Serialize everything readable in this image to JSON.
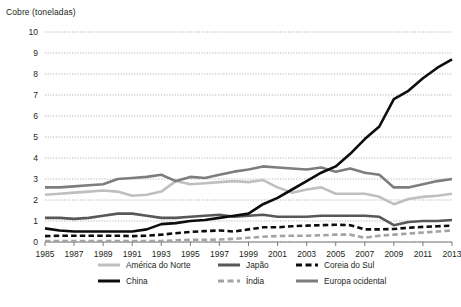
{
  "chart_data": {
    "type": "line",
    "title": "Cobre (toneladas)",
    "xlabel": "",
    "ylabel": "Cobre (toneladas)",
    "ylim": [
      0,
      10
    ],
    "ytick_step": 1,
    "yticks": [
      "0",
      "1",
      "2",
      "3",
      "4",
      "5",
      "6",
      "7",
      "8",
      "9",
      "10"
    ],
    "xlim": [
      1985,
      2013
    ],
    "xtick_labels": [
      "1985",
      "1987",
      "1989",
      "1991",
      "1993",
      "1995",
      "1997",
      "1999",
      "2001",
      "2003",
      "2005",
      "2007",
      "2009",
      "2011",
      "2013"
    ],
    "grid": "horizontal-dotted",
    "legend_position": "bottom",
    "x": [
      1985,
      1986,
      1987,
      1988,
      1989,
      1990,
      1991,
      1992,
      1993,
      1994,
      1995,
      1996,
      1997,
      1998,
      1999,
      2000,
      2001,
      2002,
      2003,
      2004,
      2005,
      2006,
      2007,
      2008,
      2009,
      2010,
      2011,
      2012,
      2013
    ],
    "series": [
      {
        "name": "América do Norte",
        "color": "#bfbfbf",
        "dash": "solid",
        "width": 2.6,
        "values": [
          2.25,
          2.3,
          2.35,
          2.4,
          2.45,
          2.4,
          2.2,
          2.25,
          2.4,
          2.9,
          2.75,
          2.8,
          2.85,
          2.9,
          2.85,
          2.95,
          2.6,
          2.35,
          2.5,
          2.6,
          2.3,
          2.3,
          2.3,
          2.15,
          1.8,
          2.05,
          2.15,
          2.2,
          2.3
        ]
      },
      {
        "name": "China",
        "color": "#0d0d0d",
        "dash": "solid",
        "width": 2.6,
        "values": [
          0.65,
          0.55,
          0.5,
          0.5,
          0.5,
          0.5,
          0.5,
          0.6,
          0.85,
          0.9,
          1.0,
          1.05,
          1.15,
          1.25,
          1.35,
          1.8,
          2.1,
          2.5,
          2.9,
          3.3,
          3.6,
          4.2,
          4.9,
          5.5,
          6.8,
          7.2,
          7.8,
          8.3,
          8.7
        ]
      },
      {
        "name": "Japão",
        "color": "#585858",
        "dash": "solid",
        "width": 2.6,
        "values": [
          1.15,
          1.15,
          1.1,
          1.15,
          1.25,
          1.35,
          1.35,
          1.25,
          1.15,
          1.15,
          1.2,
          1.25,
          1.3,
          1.2,
          1.25,
          1.3,
          1.2,
          1.2,
          1.2,
          1.25,
          1.25,
          1.25,
          1.25,
          1.2,
          0.8,
          0.95,
          1.0,
          1.0,
          1.05
        ]
      },
      {
        "name": "Índia",
        "color": "#a3a3a3",
        "dash": "dashed",
        "width": 2.6,
        "values": [
          0.05,
          0.05,
          0.05,
          0.05,
          0.05,
          0.05,
          0.05,
          0.05,
          0.05,
          0.08,
          0.1,
          0.1,
          0.12,
          0.15,
          0.2,
          0.25,
          0.28,
          0.3,
          0.3,
          0.32,
          0.35,
          0.35,
          0.2,
          0.3,
          0.35,
          0.4,
          0.45,
          0.5,
          0.55
        ]
      },
      {
        "name": "Coreia do Sul",
        "color": "#0d0d0d",
        "dash": "dashed",
        "width": 2.6,
        "values": [
          0.28,
          0.3,
          0.3,
          0.3,
          0.3,
          0.3,
          0.28,
          0.3,
          0.35,
          0.42,
          0.48,
          0.52,
          0.55,
          0.5,
          0.6,
          0.7,
          0.7,
          0.75,
          0.78,
          0.8,
          0.82,
          0.8,
          0.6,
          0.6,
          0.62,
          0.68,
          0.72,
          0.75,
          0.78
        ]
      },
      {
        "name": "Europa ocidental",
        "color": "#7d7d7d",
        "dash": "solid",
        "width": 2.6,
        "values": [
          2.6,
          2.6,
          2.65,
          2.7,
          2.75,
          3.0,
          3.05,
          3.1,
          3.2,
          2.9,
          3.1,
          3.05,
          3.2,
          3.35,
          3.45,
          3.6,
          3.55,
          3.5,
          3.45,
          3.55,
          3.35,
          3.5,
          3.3,
          3.2,
          2.6,
          2.6,
          2.75,
          2.9,
          3.0
        ]
      }
    ]
  }
}
